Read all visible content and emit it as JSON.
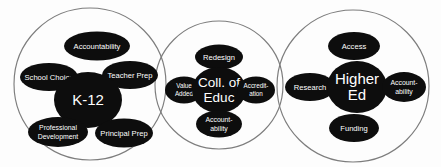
{
  "diagram": {
    "type": "venn-three-circle-cluster",
    "title": "",
    "background_color": "#fdfdfd",
    "node_color": "#0d0d0d",
    "node_text_color": "#ffffff",
    "circle_stroke_color": "#7d7d7d",
    "groups": [
      {
        "id": "k12",
        "core": {
          "label": "K-12",
          "lines": [
            "K-12"
          ]
        },
        "satellites": [
          {
            "label": "Accountability",
            "lines": [
              "Accountability"
            ]
          },
          {
            "label": "School Choice",
            "lines": [
              "School Choice"
            ]
          },
          {
            "label": "Teacher Prep",
            "lines": [
              "Teacher Prep"
            ]
          },
          {
            "label": "Professional Development",
            "lines": [
              "Professional",
              "Development"
            ]
          },
          {
            "label": "Principal Prep",
            "lines": [
              "Principal Prep"
            ]
          }
        ]
      },
      {
        "id": "coll-of-educ",
        "core": {
          "label": "Coll. of Educ",
          "lines": [
            "Coll. of",
            "Educ"
          ]
        },
        "satellites": [
          {
            "label": "Redesign",
            "lines": [
              "Redesign"
            ]
          },
          {
            "label": "Value Added",
            "lines": [
              "Value",
              "Added"
            ]
          },
          {
            "label": "Accreditation",
            "lines": [
              "Accredit-",
              "ation"
            ]
          },
          {
            "label": "Accountability",
            "lines": [
              "Account-",
              "ability"
            ]
          }
        ]
      },
      {
        "id": "higher-ed",
        "core": {
          "label": "Higher Ed",
          "lines": [
            "Higher",
            "Ed"
          ]
        },
        "satellites": [
          {
            "label": "Access",
            "lines": [
              "Access"
            ]
          },
          {
            "label": "Research",
            "lines": [
              "Research"
            ]
          },
          {
            "label": "Accountability",
            "lines": [
              "Account-",
              "ability"
            ]
          },
          {
            "label": "Funding",
            "lines": [
              "Funding"
            ]
          }
        ]
      }
    ]
  }
}
